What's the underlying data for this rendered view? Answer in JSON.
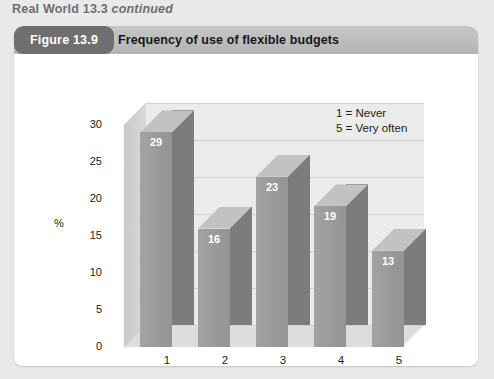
{
  "running_head": {
    "main": "Real World 13.3",
    "continued": "continued"
  },
  "figure": {
    "badge": "Figure 13.9",
    "title": "Frequency of use of flexible budgets"
  },
  "chart_data": {
    "type": "bar",
    "title": "Frequency of use of flexible budgets",
    "categories": [
      "1",
      "2",
      "3",
      "4",
      "5"
    ],
    "values": [
      29,
      16,
      23,
      19,
      13
    ],
    "xlabel": "Scale",
    "ylabel": "%",
    "ylim": [
      0,
      30
    ],
    "yticks": [
      "0",
      "5",
      "10",
      "15",
      "20",
      "25",
      "30"
    ],
    "grid": true,
    "three_d": true,
    "legend_position": "top-right",
    "legend": [
      "1 = Never",
      "5 = Very often"
    ],
    "bar_face_color": "#999999",
    "bar_side_color": "#7c7c7c",
    "bar_top_color": "#c2c2c2",
    "plot_background": "#ebebeb",
    "value_label_color": "#ffffff"
  },
  "colors": {
    "page_background": "#e9e9e9",
    "card_background": "#ffffff",
    "header_bar": "#bdbdbd",
    "badge_background": "#6f6f6f",
    "running_head_text": "#6e6e6e"
  }
}
